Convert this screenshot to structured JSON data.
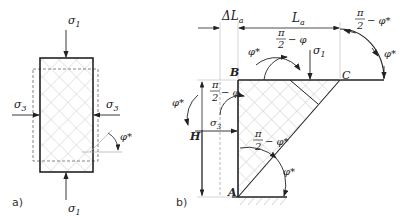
{
  "figure_a": {
    "panel_label": "a)",
    "sigma1_top": "σ",
    "sigma1_top_sub": "1",
    "sigma1_bottom": "σ",
    "sigma1_bottom_sub": "1",
    "sigma3_left": "σ",
    "sigma3_left_sub": "3",
    "sigma3_right": "σ",
    "sigma3_right_sub": "3",
    "phi_star": "φ*"
  },
  "figure_b": {
    "panel_label": "b)",
    "delta_La": "ΔL",
    "delta_La_sub": "a",
    "La": "L",
    "La_sub": "a",
    "point_A": "A",
    "point_B": "B",
    "point_C": "C",
    "H": "H",
    "sigma1": "σ",
    "sigma1_sub": "1",
    "sigma3": "σ",
    "sigma3_sub": "3",
    "pi": "π",
    "two": "2",
    "minus_phi": "− φ",
    "minus_phi_star": "− φ*",
    "phi_star": "φ*",
    "phi": "φ"
  },
  "colors": {
    "line": "#222222",
    "hatch": "#c8c8c8",
    "dashed": "#777777",
    "thin": "#aaaaaa"
  }
}
